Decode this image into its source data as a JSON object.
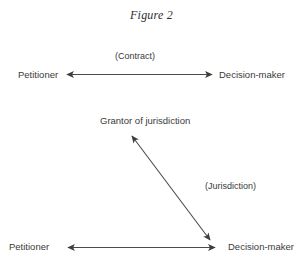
{
  "figure": {
    "title": "Figure 2",
    "background_color": "#ffffff",
    "ink_color": "#3a3a3a",
    "arrow_color": "#4a4a4a"
  },
  "nodes": {
    "petitioner_top": "Petitioner",
    "decision_maker_top": "Decision-maker",
    "grantor": "Grantor of jurisdiction",
    "petitioner_bottom": "Petitioner",
    "decision_maker_bottom": "Decision-maker"
  },
  "relations": {
    "contract": "(Contract)",
    "jurisdiction": "(Jurisdiction)"
  },
  "arrows": [
    {
      "name": "contract-arrow",
      "style": "double-headed",
      "orientation": "horizontal",
      "from": "Petitioner",
      "to": "Decision-maker",
      "label": "(Contract)"
    },
    {
      "name": "jurisdiction-arrow",
      "style": "double-headed",
      "orientation": "diagonal",
      "from": "Grantor of jurisdiction",
      "to": "Decision-maker",
      "label": "(Jurisdiction)"
    },
    {
      "name": "bottom-relation-arrow",
      "style": "double-headed",
      "orientation": "horizontal",
      "from": "Petitioner",
      "to": "Decision-maker",
      "label": ""
    }
  ]
}
